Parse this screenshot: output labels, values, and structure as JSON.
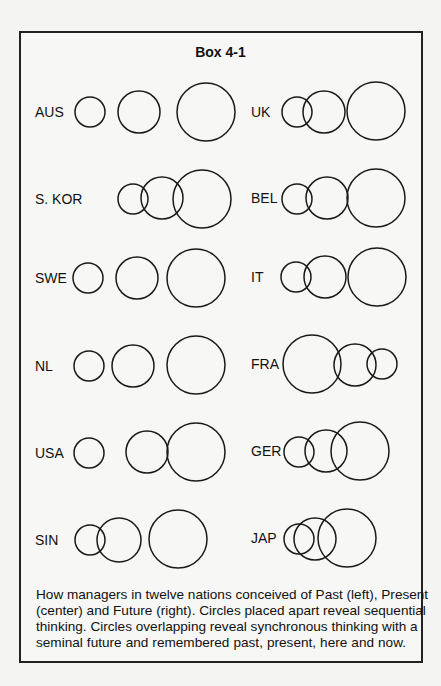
{
  "box": {
    "title": "Box 4-1"
  },
  "nations": [
    {
      "label": "AUS",
      "label_x": 35,
      "label_y": 117,
      "circles": [
        {
          "role": "past",
          "cx": 90,
          "cy": 112,
          "r": 15
        },
        {
          "role": "present",
          "cx": 139,
          "cy": 112,
          "r": 21
        },
        {
          "role": "future",
          "cx": 206,
          "cy": 112,
          "r": 29
        }
      ]
    },
    {
      "label": "UK",
      "label_x": 251,
      "label_y": 117,
      "circles": [
        {
          "role": "past",
          "cx": 297,
          "cy": 112,
          "r": 15
        },
        {
          "role": "present",
          "cx": 324,
          "cy": 112,
          "r": 21
        },
        {
          "role": "future",
          "cx": 376,
          "cy": 111,
          "r": 29
        }
      ]
    },
    {
      "label": "S. KOR",
      "label_x": 35,
      "label_y": 204,
      "circles": [
        {
          "role": "past",
          "cx": 133,
          "cy": 199,
          "r": 15
        },
        {
          "role": "present",
          "cx": 162,
          "cy": 198,
          "r": 21
        },
        {
          "role": "future",
          "cx": 202,
          "cy": 199,
          "r": 29
        }
      ]
    },
    {
      "label": "BEL",
      "label_x": 251,
      "label_y": 203,
      "circles": [
        {
          "role": "past",
          "cx": 297,
          "cy": 199,
          "r": 15
        },
        {
          "role": "present",
          "cx": 327,
          "cy": 198,
          "r": 21
        },
        {
          "role": "future",
          "cx": 376,
          "cy": 198,
          "r": 29
        }
      ]
    },
    {
      "label": "SWE",
      "label_x": 35,
      "label_y": 283,
      "circles": [
        {
          "role": "past",
          "cx": 88,
          "cy": 278,
          "r": 15
        },
        {
          "role": "present",
          "cx": 137,
          "cy": 278,
          "r": 21
        },
        {
          "role": "future",
          "cx": 196,
          "cy": 278,
          "r": 29
        }
      ]
    },
    {
      "label": "IT",
      "label_x": 251,
      "label_y": 282,
      "circles": [
        {
          "role": "past",
          "cx": 296,
          "cy": 277,
          "r": 15
        },
        {
          "role": "present",
          "cx": 325,
          "cy": 277,
          "r": 21
        },
        {
          "role": "future",
          "cx": 377,
          "cy": 277,
          "r": 29
        }
      ]
    },
    {
      "label": "NL",
      "label_x": 35,
      "label_y": 371,
      "circles": [
        {
          "role": "past",
          "cx": 89,
          "cy": 366,
          "r": 15
        },
        {
          "role": "present",
          "cx": 133,
          "cy": 366,
          "r": 21
        },
        {
          "role": "future",
          "cx": 196,
          "cy": 365,
          "r": 29
        }
      ]
    },
    {
      "label": "FRA",
      "label_x": 251,
      "label_y": 369,
      "circles": [
        {
          "role": "past",
          "cx": 312,
          "cy": 364,
          "r": 29
        },
        {
          "role": "present",
          "cx": 355,
          "cy": 365,
          "r": 21
        },
        {
          "role": "future",
          "cx": 382,
          "cy": 364,
          "r": 15
        }
      ]
    },
    {
      "label": "USA",
      "label_x": 35,
      "label_y": 458,
      "circles": [
        {
          "role": "past",
          "cx": 89,
          "cy": 453,
          "r": 15
        },
        {
          "role": "present",
          "cx": 147,
          "cy": 452,
          "r": 21
        },
        {
          "role": "future",
          "cx": 196,
          "cy": 452,
          "r": 29
        }
      ]
    },
    {
      "label": "GER",
      "label_x": 251,
      "label_y": 456,
      "circles": [
        {
          "role": "past",
          "cx": 299,
          "cy": 452,
          "r": 15
        },
        {
          "role": "present",
          "cx": 326,
          "cy": 451,
          "r": 21
        },
        {
          "role": "future",
          "cx": 360,
          "cy": 451,
          "r": 29
        }
      ]
    },
    {
      "label": "SIN",
      "label_x": 35,
      "label_y": 545,
      "circles": [
        {
          "role": "past",
          "cx": 90,
          "cy": 540,
          "r": 15
        },
        {
          "role": "present",
          "cx": 119,
          "cy": 540,
          "r": 22
        },
        {
          "role": "future",
          "cx": 178,
          "cy": 539,
          "r": 29
        }
      ]
    },
    {
      "label": "JAP",
      "label_x": 251,
      "label_y": 543,
      "circles": [
        {
          "role": "past",
          "cx": 299,
          "cy": 539,
          "r": 15
        },
        {
          "role": "present",
          "cx": 315,
          "cy": 539,
          "r": 21
        },
        {
          "role": "future",
          "cx": 347,
          "cy": 538,
          "r": 29
        }
      ]
    }
  ],
  "caption": {
    "lines": [
      "How managers in twelve nations conceived of Past (left), Present",
      "(center) and Future (right). Circles placed apart reveal sequential",
      "thinking. Circles overlapping reveal synchronous thinking with a",
      "seminal  future and remembered past, present, here and now."
    ]
  }
}
